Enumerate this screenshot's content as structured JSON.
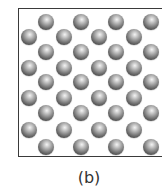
{
  "figure": {
    "caption": "(b)",
    "sphere_color": "#7a7a7a",
    "frame_color": "#3a3a3a"
  },
  "lattice": {
    "rows": [
      {
        "y": 22,
        "x": [
          46,
          81,
          116,
          151
        ]
      },
      {
        "y": 37,
        "x": [
          29,
          64,
          99,
          134
        ]
      },
      {
        "y": 52,
        "x": [
          46,
          81,
          116,
          151
        ]
      },
      {
        "y": 68,
        "x": [
          29,
          64,
          99,
          134
        ]
      },
      {
        "y": 82,
        "x": [
          46,
          81,
          116,
          151
        ]
      },
      {
        "y": 98,
        "x": [
          29,
          64,
          99,
          134
        ]
      },
      {
        "y": 113,
        "x": [
          46,
          81,
          116,
          151
        ]
      },
      {
        "y": 130,
        "x": [
          29,
          64,
          99,
          134
        ]
      },
      {
        "y": 147,
        "x": [
          46,
          81,
          116,
          151
        ]
      }
    ],
    "sphere_diameter": 16
  }
}
